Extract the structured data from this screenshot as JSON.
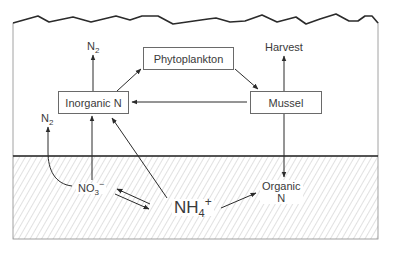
{
  "figure": {
    "type": "nitrogen-cycle-diagram",
    "colors": {
      "line": "#2b2b2b",
      "box_border": "#6a6a6a",
      "hatch": "#b5b5b5",
      "text": "#3a3a3a"
    }
  },
  "water_column": {
    "boxes": {
      "phytoplankton": "Phytoplankton",
      "inorganic_n": "Inorganic N",
      "mussel": "Mussel"
    },
    "outputs": {
      "n2_top": {
        "base": "N",
        "sub": "2"
      },
      "harvest": "Harvest"
    }
  },
  "sediment": {
    "n2_side": {
      "base": "N",
      "sub": "2"
    },
    "nitrate": {
      "base": "NO",
      "sub": "3",
      "sup": "−"
    },
    "ammonium": {
      "base": "NH",
      "sub": "4",
      "sup": "+"
    },
    "organic_n": {
      "line1": "Organic",
      "line2": "N"
    }
  },
  "flows": [
    {
      "from": "Inorganic N",
      "to": "Phytoplankton"
    },
    {
      "from": "Phytoplankton",
      "to": "Mussel"
    },
    {
      "from": "Mussel",
      "to": "Inorganic N"
    },
    {
      "from": "Inorganic N",
      "to": "N2"
    },
    {
      "from": "Mussel",
      "to": "Harvest"
    },
    {
      "from": "Mussel",
      "to": "Organic N"
    },
    {
      "from": "NO3-",
      "to": "Inorganic N"
    },
    {
      "from": "NO3-",
      "to": "N2"
    },
    {
      "from": "NH4+",
      "to": "Inorganic N"
    },
    {
      "from": "NH4+",
      "to": "Organic N"
    },
    {
      "from": "NO3-",
      "to": "NH4+",
      "bidirectional": true
    }
  ]
}
